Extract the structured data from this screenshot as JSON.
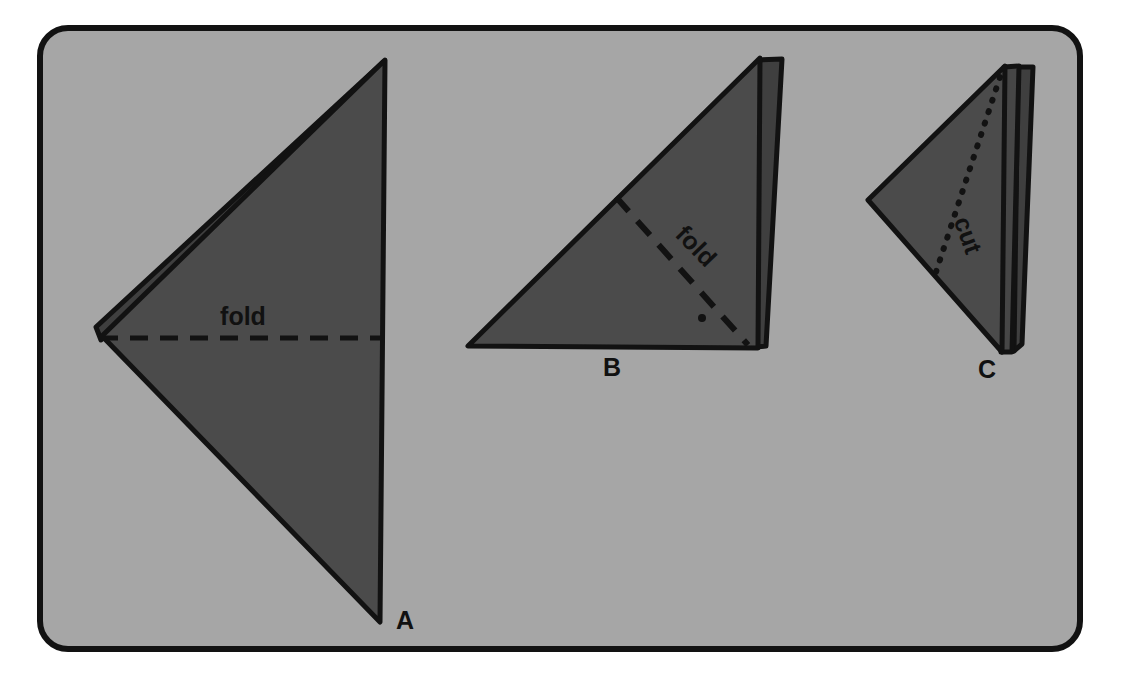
{
  "figure": {
    "kind": "paper-folding-and-cutting-diagram",
    "canvas": {
      "width": 1121,
      "height": 700
    },
    "page_background": "#ffffff",
    "frame": {
      "name": "rounded-panel-frame",
      "x": 37,
      "y": 25,
      "width": 1046,
      "height": 627,
      "corner_radius": 28,
      "border_color": "#121212",
      "border_width": 6,
      "fill": "#a6a6a6"
    },
    "paper_fill": "#4b4b4b",
    "paper_fill_back": "#3f3f3f",
    "outline_color": "#121212",
    "outline_width": 5,
    "panels": [
      {
        "id": "A",
        "label": "A",
        "label_x": 396,
        "label_y": 629,
        "annotation": "fold",
        "annotation_kind": "dashed-line",
        "annotation_x": 243,
        "annotation_y": 325,
        "annotation_rotation": 0,
        "shape_points": "385,60 102,336 380,622",
        "layer_points": "383,62 96,327 101,340",
        "guide_line": {
          "x1": 100,
          "y1": 338,
          "x2": 384,
          "y2": 338
        }
      },
      {
        "id": "B",
        "label": "B",
        "label_x": 612,
        "label_y": 376,
        "annotation": "fold",
        "annotation_kind": "dashed-line",
        "annotation_x": 690,
        "annotation_y": 252,
        "annotation_rotation": 46,
        "shape_points": "760,58 468,346 758,348",
        "layer_points": "782,59 766,346 757,347 759,60",
        "guide_line": {
          "x1": 616,
          "y1": 197,
          "x2": 748,
          "y2": 345
        },
        "dot": {
          "cx": 702,
          "cy": 318,
          "r": 4
        }
      },
      {
        "id": "C",
        "label": "C",
        "label_x": 987,
        "label_y": 378,
        "annotation": "cut",
        "annotation_kind": "dotted-line",
        "annotation_x": 960,
        "annotation_y": 238,
        "annotation_rotation": 70,
        "shape_points": "1005,66 868,200 1002,352",
        "layer_points_1": "1019,66 1012,352 1001,352 1004,67",
        "layer_points_2": "1033,67 1022,344 1014,351 1018,67",
        "guide_line": {
          "x1": 1000,
          "y1": 77,
          "x2": 936,
          "y2": 272
        }
      }
    ]
  }
}
